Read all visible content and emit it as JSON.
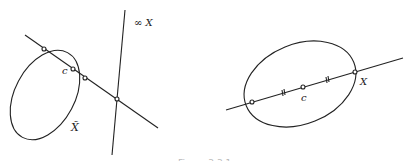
{
  "figure": {
    "left_panel": {
      "labels": {
        "center": "c",
        "infinity_line": "∞ X",
        "curve": "X̃"
      },
      "elements": [
        "ellipse X-tilde",
        "secant line through c",
        "line at infinity",
        "intersection points"
      ]
    },
    "right_panel": {
      "labels": {
        "center": "c",
        "curve": "X"
      },
      "elements": [
        "ellipse X",
        "chord through c",
        "equal-segment tick marks",
        "intersection points"
      ]
    },
    "caption": "Figure 3.3.1"
  },
  "colors": {
    "stroke": "#222222",
    "background": "#ffffff"
  }
}
